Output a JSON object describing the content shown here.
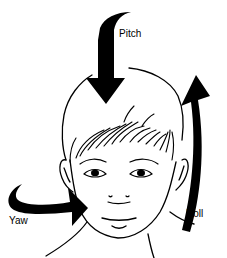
{
  "figure": {
    "labels": {
      "pitch": "Pitch",
      "roll": "Roll",
      "yaw": "Yaw"
    },
    "arrows": [
      {
        "name": "pitch",
        "direction": "down",
        "color": "#000000"
      },
      {
        "name": "roll",
        "direction": "up-curved",
        "color": "#000000"
      },
      {
        "name": "yaw",
        "direction": "right-curved",
        "color": "#000000"
      }
    ],
    "line_color": "#000000",
    "background": "#ffffff"
  }
}
